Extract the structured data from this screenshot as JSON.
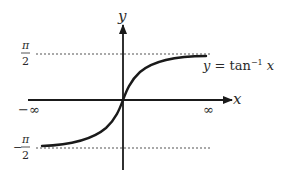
{
  "diagram": {
    "axes": {
      "x_label": "x",
      "y_label": "y"
    },
    "asymptotes": {
      "upper": {
        "numerator": "π",
        "denominator": "2",
        "sign": ""
      },
      "lower": {
        "numerator": "π",
        "denominator": "2",
        "sign": "−"
      }
    },
    "x_limits": {
      "left": "−∞",
      "right": "∞"
    },
    "curve_label": {
      "lhs": "y",
      "eq": " = tan",
      "exp": "−1",
      "arg": " x"
    },
    "colors": {
      "curve": "#1a1a1a",
      "axes": "#1a1a1a",
      "asymptote": "#555555",
      "text": "#2a2a2a"
    }
  }
}
